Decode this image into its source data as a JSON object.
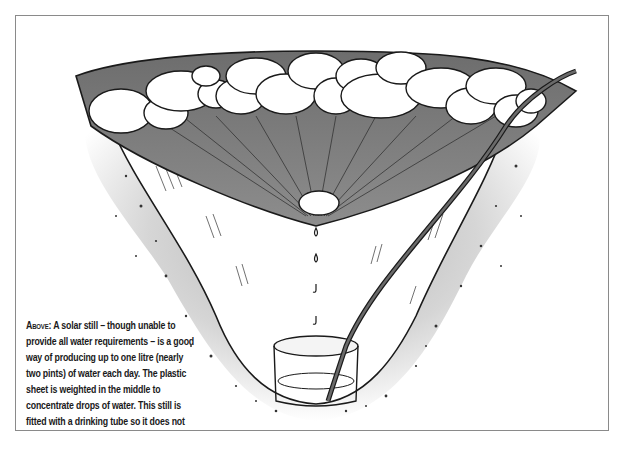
{
  "figure": {
    "elements": [
      "plastic-sheet",
      "anchor-rocks",
      "center-weight-stone",
      "water-drops",
      "collection-container",
      "drinking-tube",
      "soil-pit"
    ],
    "colors": {
      "sheet": "#7d7d7d",
      "soil": "#cfcfcf",
      "line": "#1a1a1a",
      "frame": "#8a8a8a"
    }
  },
  "caption": {
    "lead": "Above:",
    "text": "A solar still – though unable to provide all water requirements – is a good way of producing up to one litre (nearly two pints) of water each day. The plastic sheet is weighted in the middle to concentrate drops of water. This still is fitted with a drinking tube so it does not have to be disassembled each day."
  }
}
